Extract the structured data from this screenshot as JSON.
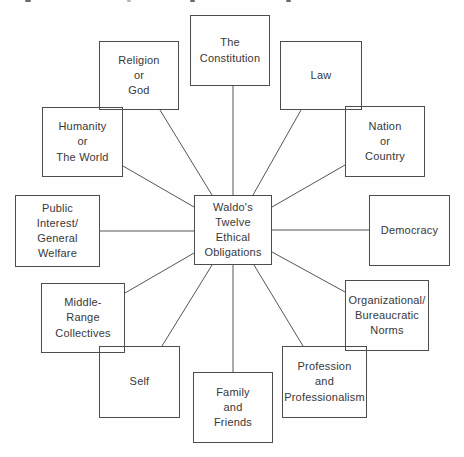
{
  "figure": {
    "center": {
      "label": "Waldo's\nTwelve\nEthical\nObligations"
    },
    "nodes": [
      {
        "id": "the-constitution",
        "label": "The\nConstitution"
      },
      {
        "id": "law",
        "label": "Law"
      },
      {
        "id": "nation-or-country",
        "label": "Nation\nor\nCountry"
      },
      {
        "id": "democracy",
        "label": "Democracy"
      },
      {
        "id": "organizational-bureaucratic-norms",
        "label": "Organizational/\nBureaucratic\nNorms"
      },
      {
        "id": "profession-and-professionalism",
        "label": "Profession\nand\nProfessionalism"
      },
      {
        "id": "family-and-friends",
        "label": "Family\nand\nFriends"
      },
      {
        "id": "self",
        "label": "Self"
      },
      {
        "id": "middle-range-collectives",
        "label": "Middle-\nRange\nCollectives"
      },
      {
        "id": "public-interest-general-welfare",
        "label": "Public\nInterest/\nGeneral\nWelfare"
      },
      {
        "id": "humanity-or-the-world",
        "label": "Humanity\nor\nThe World"
      },
      {
        "id": "religion-or-god",
        "label": "Religion\nor\nGod"
      }
    ]
  },
  "colors": {
    "background": "#fefefe",
    "box_border": "#4d4d4d",
    "connector_line": "#565656",
    "text": "#383838"
  }
}
